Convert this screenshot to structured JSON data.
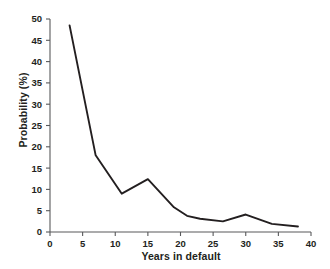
{
  "chart_data": {
    "type": "line",
    "title": "",
    "subtitle": "",
    "xlabel": "Years in default",
    "ylabel": "Probability (%)",
    "xlim": [
      0,
      40
    ],
    "ylim": [
      0,
      50
    ],
    "xticks": [
      0,
      5,
      10,
      15,
      20,
      25,
      30,
      35,
      40
    ],
    "xtick_labels": [
      "0",
      "5",
      "10",
      "15",
      "20",
      "25",
      "30",
      "35",
      "40"
    ],
    "yticks": [
      0,
      5,
      10,
      15,
      20,
      25,
      30,
      35,
      40,
      45,
      50
    ],
    "ytick_labels": [
      "0",
      "5",
      "10",
      "15",
      "20",
      "25",
      "30",
      "35",
      "40",
      "45",
      "50"
    ],
    "grid": false,
    "legend": false,
    "legend_position": "none",
    "line_color": "#231f20",
    "line_width": 1.9,
    "axis_color": "#58595b",
    "series": [
      {
        "name": "Probability of exiting default",
        "x": [
          3,
          7,
          11,
          15,
          19,
          21,
          23,
          26.5,
          30,
          34,
          38
        ],
        "y": [
          48.5,
          18.0,
          9.0,
          12.4,
          5.8,
          3.8,
          3.1,
          2.5,
          4.1,
          1.9,
          1.3
        ]
      }
    ]
  },
  "axes": {
    "y_title": "Probability (%)",
    "x_title": "Years in default"
  }
}
